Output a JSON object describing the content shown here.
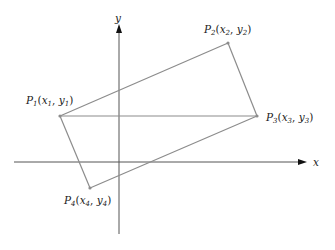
{
  "diagram": {
    "axes": {
      "x_label": "x",
      "y_label": "y",
      "color": "#4a4a4a"
    },
    "shape": {
      "type": "rotated-rectangle",
      "color": "#8a8a8a",
      "diagonal": "P1-P3 horizontal"
    },
    "points": [
      {
        "id": "P1",
        "letter": "P",
        "index": "1",
        "label": "P1(x1, y1)",
        "x_var": "x",
        "x_sub": "1",
        "y_var": "y",
        "y_sub": "1"
      },
      {
        "id": "P2",
        "letter": "P",
        "index": "2",
        "label": "P2(x2, y2)",
        "x_var": "x",
        "x_sub": "2",
        "y_var": "y",
        "y_sub": "2"
      },
      {
        "id": "P3",
        "letter": "P",
        "index": "3",
        "label": "P3(x3, y3)",
        "x_var": "x",
        "x_sub": "3",
        "y_var": "y",
        "y_sub": "3"
      },
      {
        "id": "P4",
        "letter": "P",
        "index": "4",
        "label": "P4(x4, y4)",
        "x_var": "x",
        "x_sub": "4",
        "y_var": "y",
        "y_sub": "4"
      }
    ],
    "punct": {
      "open": "(",
      "comma": ", ",
      "close": ")"
    }
  }
}
